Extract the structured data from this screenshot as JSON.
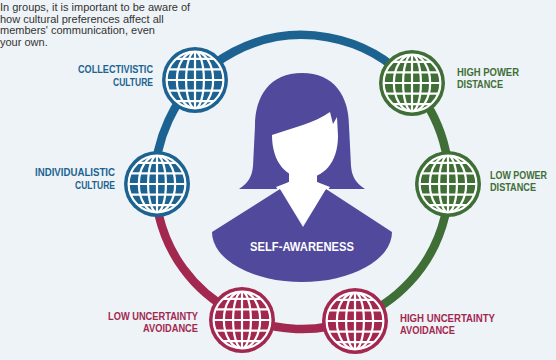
{
  "intro": {
    "lines": [
      "In groups, it is important to be aware of",
      "how cultural preferences affect all",
      "members' communication, even",
      "your own."
    ]
  },
  "colors": {
    "culture": "#1d6391",
    "power": "#3f6f36",
    "uncertainty": "#a3284f",
    "self": "#51499b",
    "background": "#eef3f7"
  },
  "center": {
    "icon": "person-icon",
    "label": "SELF-AWARENESS"
  },
  "dimensions": [
    {
      "id": "collectivistic",
      "group": "culture",
      "icon": "globe-icon",
      "lines": [
        "COLLECTIVISTIC",
        "CULTURE"
      ]
    },
    {
      "id": "individualistic",
      "group": "culture",
      "icon": "globe-icon",
      "lines": [
        "INDIVIDUALISTIC",
        "CULTURE"
      ]
    },
    {
      "id": "high-power",
      "group": "power",
      "icon": "globe-icon",
      "lines": [
        "HIGH POWER",
        "DISTANCE"
      ]
    },
    {
      "id": "low-power",
      "group": "power",
      "icon": "globe-icon",
      "lines": [
        "LOW POWER",
        "DISTANCE"
      ]
    },
    {
      "id": "low-uncertainty",
      "group": "uncertainty",
      "icon": "globe-icon",
      "lines": [
        "LOW UNCERTAINTY",
        "AVOIDANCE"
      ]
    },
    {
      "id": "high-uncertainty",
      "group": "uncertainty",
      "icon": "globe-icon",
      "lines": [
        "HIGH UNCERTAINTY",
        "AVOIDANCE"
      ]
    }
  ]
}
